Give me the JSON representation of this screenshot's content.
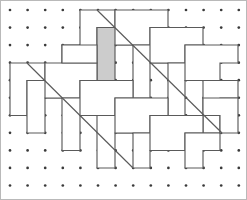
{
  "figure": {
    "canvas": {
      "width": 247,
      "height": 200
    },
    "background_color": "#ffffff",
    "frame": {
      "visible": true,
      "color": "#b9b9b9",
      "x": 0.5,
      "y": 0.5,
      "width": 246,
      "height": 199
    },
    "grid": {
      "type": "dot-lattice",
      "origin_x": 10,
      "origin_y": 10,
      "spacing_x": 17.6,
      "spacing_y": 17.55,
      "cols": 14,
      "rows": 11,
      "dot_radius": 1.35,
      "dot_color": "#3a3a3a"
    },
    "style": {
      "tile_fill": "#ffffff",
      "tile_stroke": "#5a5a5a",
      "tile_stroke_width": 1.15,
      "shaded_tile_fill": "#cccccc",
      "diagonal_stroke": "#5a5a5a"
    },
    "tiles": [
      {
        "name": "tile-01",
        "shaded": false,
        "points": "80,10 115,10 115,27.5 97,27.5 97,63 62,63 62,45 80,45"
      },
      {
        "name": "tile-02",
        "shaded": true,
        "points": "97,27.5 133,27.5 133,45 115,45 115,80.5 97,80.5"
      },
      {
        "name": "tile-03",
        "shaded": false,
        "points": "115,10 168,10 168,27.5 150,27.5 150,45 115,45 115,27.5"
      },
      {
        "name": "tile-04",
        "shaded": false,
        "points": "133,45 168,45 168,63 150,63 150,98 133,98"
      },
      {
        "name": "tile-05",
        "shaded": false,
        "points": "150,27.5 203,27.5 203,45 185,45 185,63 150,63 150,45"
      },
      {
        "name": "tile-06",
        "shaded": false,
        "points": "168,63 203,63 203,80.5 185,80.5 185,115.5 168,115.5"
      },
      {
        "name": "tile-07",
        "shaded": false,
        "points": "185,45 238,45 238,63 220,63 220,80.5 185,80.5 185,63"
      },
      {
        "name": "tile-08",
        "shaded": false,
        "points": "203,80.5 238,80.5 238,98 220,98 220,133 203,133"
      },
      {
        "name": "tile-09",
        "shaded": false,
        "points": "10,63 45,63 45,80.5 27,80.5 27,115.5 10,115.5"
      },
      {
        "name": "tile-10",
        "shaded": false,
        "points": "27,80.5 62,80.5 62,98 45,98 45,133 27,133"
      },
      {
        "name": "tile-11",
        "shaded": false,
        "points": "45,63 97,63 97,80.5 80,80.5 80,98 45,98 45,80.5"
      },
      {
        "name": "tile-12",
        "shaded": false,
        "points": "62,98 97,98 97,115.5 80,115.5 80,150.5 62,150.5"
      },
      {
        "name": "tile-13",
        "shaded": false,
        "points": "80,80.5 133,80.5 133,98 115,98 115,115.5 80,115.5 80,98"
      },
      {
        "name": "tile-14",
        "shaded": false,
        "points": "97,115.5 133,115.5 133,133 115,133 115,168 97,168"
      },
      {
        "name": "tile-15",
        "shaded": false,
        "points": "115,98 168,98 168,115.5 150,115.5 150,133 115,133 115,115.5"
      },
      {
        "name": "tile-16",
        "shaded": false,
        "points": "133,133 168,133 168,150.5 150,150.5 150,168 133,168"
      },
      {
        "name": "tile-17",
        "shaded": false,
        "points": "150,115.5 203,115.5 203,133 185,133 185,150.5 150,150.5 150,133"
      },
      {
        "name": "tile-18",
        "shaded": false,
        "points": "185,133 220,133 220,150.5 203,150.5 203,168 185,168"
      },
      {
        "name": "tile-19",
        "shaded": false,
        "points": "203,98 238,98 238,133 220,133 220,115.5 203,115.5"
      },
      {
        "name": "tile-20",
        "shaded": false,
        "points": "62,45 97,45 97,63 62,63"
      }
    ],
    "diagonals": [
      {
        "name": "diagonal-upper",
        "x1": 97,
        "y1": 10,
        "x2": 222,
        "y2": 133
      },
      {
        "name": "diagonal-lower",
        "x1": 27,
        "y1": 63,
        "x2": 133,
        "y2": 168
      }
    ]
  }
}
